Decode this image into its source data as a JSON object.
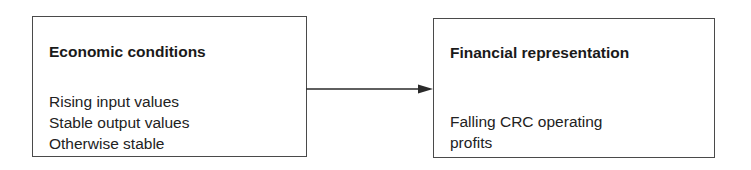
{
  "diagram": {
    "type": "flow",
    "nodes": [
      {
        "id": "economic_conditions",
        "title": "Economic conditions",
        "lines": [
          "Rising input values",
          "Stable output values",
          "Otherwise stable"
        ]
      },
      {
        "id": "financial_representation",
        "title": "Financial representation",
        "lines": [
          "Falling CRC operating",
          "profits"
        ]
      }
    ],
    "edges": [
      {
        "from": "economic_conditions",
        "to": "financial_representation",
        "style": "arrow"
      }
    ],
    "colors": {
      "border": "#4a4a4a",
      "text": "#1e1e1e",
      "arrow": "#2a2a2a",
      "background": "#ffffff"
    }
  }
}
